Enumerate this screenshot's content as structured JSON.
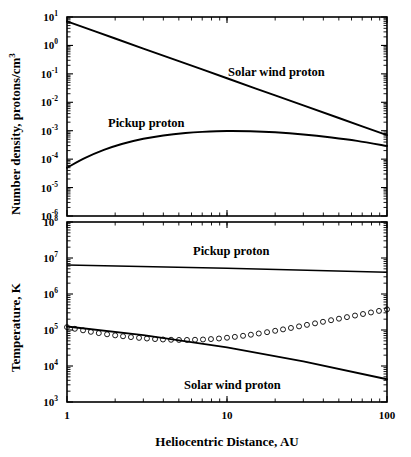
{
  "figure": {
    "name": "solar-wind-pickup-proton-radial-profiles"
  },
  "xaxis": {
    "label": "Heliocentric Distance, AU",
    "ticks": [
      "1",
      "10",
      "100"
    ],
    "min": 1,
    "max": 100,
    "scale": "log"
  },
  "panel_top": {
    "ylabel_main": "Number density, protons/cm",
    "ylabel_sup": "3",
    "ylabel_full": "Number density, protons/cm3",
    "tick_exponents": [
      "1",
      "0",
      "-1",
      "-2",
      "-3",
      "-4",
      "-5",
      "-6"
    ],
    "tick_mantissa": "10",
    "labels": {
      "solar_wind": "Solar wind proton",
      "pickup": "Pickup proton"
    }
  },
  "panel_bottom": {
    "ylabel_main": "Temperature, K",
    "tick_exponents": [
      "8",
      "7",
      "6",
      "5",
      "4",
      "3"
    ],
    "tick_mantissa": "10",
    "labels": {
      "pickup": "Pickup proton",
      "solar_wind": "Solar wind proton"
    }
  },
  "chart_data": [
    {
      "type": "line",
      "title": "Number density vs heliocentric distance",
      "xlabel": "Heliocentric Distance, AU",
      "ylabel": "Number density, protons/cm3",
      "xscale": "log",
      "yscale": "log",
      "xlim": [
        1,
        100
      ],
      "ylim": [
        1e-06,
        10
      ],
      "grid": false,
      "legend": "inline-annotations",
      "series": [
        {
          "name": "Solar wind proton",
          "marker": "none",
          "x": [
            1,
            1.5,
            2,
            3,
            5,
            7,
            10,
            15,
            20,
            30,
            50,
            70,
            100
          ],
          "y": [
            7.0,
            3.11,
            1.75,
            0.778,
            0.28,
            0.143,
            0.07,
            0.0311,
            0.0175,
            0.00778,
            0.0028,
            0.00143,
            0.0007
          ]
        },
        {
          "name": "Pickup proton",
          "marker": "none",
          "x": [
            1,
            1.3,
            1.7,
            2.2,
            3,
            4,
            5.5,
            7,
            10,
            14,
            20,
            30,
            45,
            65,
            100
          ],
          "y": [
            5e-05,
            0.00011,
            0.00021,
            0.00034,
            0.00052,
            0.00068,
            0.00083,
            0.00091,
            0.00098,
            0.00096,
            0.00088,
            0.00074,
            0.00058,
            0.00044,
            0.00029
          ]
        }
      ]
    },
    {
      "type": "line",
      "title": "Temperature vs heliocentric distance",
      "xlabel": "Heliocentric Distance, AU",
      "ylabel": "Temperature, K",
      "xscale": "log",
      "yscale": "log",
      "xlim": [
        1,
        100
      ],
      "ylim": [
        1000,
        100000000
      ],
      "grid": false,
      "legend": "inline-annotations",
      "series": [
        {
          "name": "Pickup proton",
          "marker": "none",
          "x": [
            1,
            10,
            100
          ],
          "y": [
            6400000,
            5200000,
            4000000
          ]
        },
        {
          "name": "Solar wind proton",
          "marker": "none",
          "x": [
            1,
            3,
            10,
            30,
            100
          ],
          "y": [
            125000,
            72000,
            33000,
            13500,
            4300
          ]
        },
        {
          "name": "Pickup-heated solar wind (circles)",
          "marker": "open-circle",
          "x": [
            1.0,
            1.12,
            1.26,
            1.41,
            1.58,
            1.78,
            2.0,
            2.24,
            2.51,
            2.82,
            3.16,
            3.55,
            3.98,
            4.47,
            5.01,
            5.62,
            6.31,
            7.08,
            7.94,
            8.91,
            10.0,
            11.2,
            12.6,
            14.1,
            15.8,
            17.8,
            20.0,
            22.4,
            25.1,
            28.2,
            31.6,
            35.5,
            39.8,
            44.7,
            50.1,
            56.2,
            63.1,
            70.8,
            79.4,
            89.1,
            100.0
          ],
          "y": [
            120000,
            108000,
            98000,
            89000,
            82000,
            76000,
            71000,
            67000,
            63500,
            60500,
            58000,
            56000,
            54500,
            53500,
            53000,
            53000,
            53500,
            54500,
            56000,
            58000,
            61000,
            64500,
            69000,
            74000,
            80000,
            87000,
            95000,
            104000,
            114000,
            126000,
            139000,
            153000,
            169000,
            187000,
            206000,
            228000,
            252000,
            278000,
            307000,
            339000,
            375000
          ]
        }
      ]
    }
  ]
}
